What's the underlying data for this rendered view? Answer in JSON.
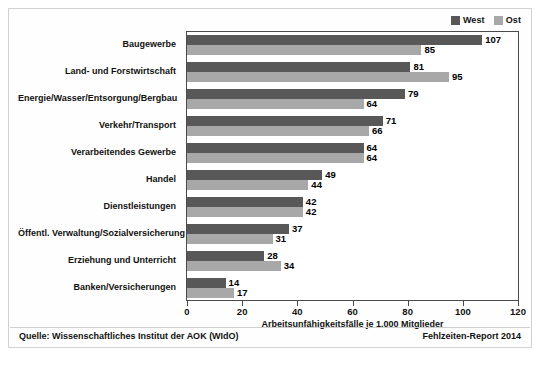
{
  "chart_data": {
    "type": "bar",
    "orientation": "horizontal",
    "title": "",
    "xlabel": "Arbeitsunfähigkeitsfälle je 1.000 Mitglieder",
    "ylabel": "",
    "xlim": [
      0,
      120
    ],
    "xticks": [
      0,
      20,
      40,
      60,
      80,
      100,
      120
    ],
    "grid": false,
    "legend_position": "top-right",
    "categories": [
      "Baugewerbe",
      "Land- und Forstwirtschaft",
      "Energie/Wasser/Entsorgung/Bergbau",
      "Verkehr/Transport",
      "Verarbeitendes Gewerbe",
      "Handel",
      "Dienstleistungen",
      "Öffentl. Verwaltung/Sozialversicherung",
      "Erziehung und Unterricht",
      "Banken/Versicherungen"
    ],
    "series": [
      {
        "name": "West",
        "color": "#585858",
        "values": [
          107,
          81,
          79,
          71,
          64,
          49,
          42,
          37,
          28,
          14
        ]
      },
      {
        "name": "Ost",
        "color": "#a8a8a8",
        "values": [
          85,
          95,
          64,
          66,
          64,
          44,
          42,
          31,
          34,
          17
        ]
      }
    ]
  },
  "legend": {
    "items": [
      {
        "label": "West",
        "color": "#585858"
      },
      {
        "label": "Ost",
        "color": "#a8a8a8"
      }
    ]
  },
  "axis": {
    "tick_labels": [
      "0",
      "20",
      "40",
      "60",
      "80",
      "100",
      "120"
    ],
    "title": "Arbeitsunfähigkeitsfälle je 1.000 Mitglieder"
  },
  "footer": {
    "source": "Quelle: Wissenschaftliches Institut der AOK (WIdO)",
    "report": "Fehlzeiten-Report 2014"
  }
}
